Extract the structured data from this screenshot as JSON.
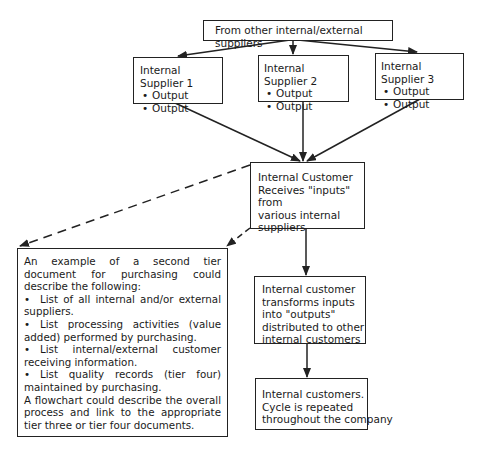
{
  "diagram": {
    "top_box": "From other internal/external suppliers",
    "suppliers": [
      {
        "title": "Internal Supplier 1",
        "outputs": [
          "Output",
          "Output"
        ]
      },
      {
        "title": "Internal Supplier 2",
        "outputs": [
          "Output",
          "Output"
        ]
      },
      {
        "title": "Internal Supplier 3",
        "outputs": [
          "Output",
          "Output"
        ]
      }
    ],
    "customer_box": {
      "lines": [
        "Internal Customer",
        "Receives \"inputs\" from",
        "various internal",
        "suppliers"
      ]
    },
    "example_box": {
      "intro": "An example of a second tier document for purchasing could describe the following:",
      "bullets": [
        "List of all internal and/or external suppliers.",
        "List processing activities (value added) performed by purchasing.",
        "List internal/external customer receiving information.",
        "List quality records (tier four) maintained by purchasing."
      ],
      "closing": "A flowchart could describe the overall process and link to the appropriate tier three or tier four documents."
    },
    "transform_box": {
      "lines": [
        "Internal customer",
        "transforms inputs",
        "into \"outputs\"",
        "distributed to other",
        "internal customers"
      ]
    },
    "cycle_box": {
      "lines": [
        "Internal customers.",
        "Cycle is repeated",
        "throughout the company"
      ]
    },
    "bullet_glyph": "•"
  }
}
